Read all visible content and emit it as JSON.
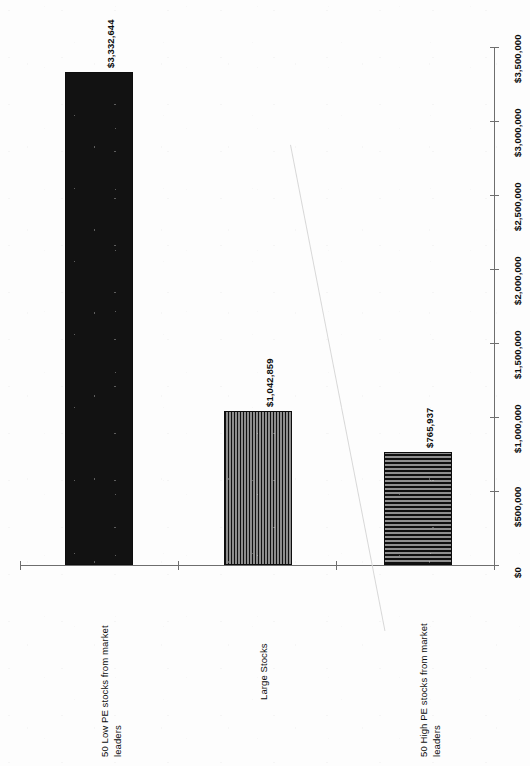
{
  "chart_data": {
    "type": "bar",
    "title": "",
    "subtitle": "",
    "xlabel": "",
    "ylabel": "",
    "orientation": "vertical-bars-rotated-90",
    "grid": false,
    "legend": null,
    "categories": [
      "50 Low PE stocks from market leaders",
      "Large Stocks",
      "50 High PE stocks from market leaders"
    ],
    "values": [
      3332644,
      1042859,
      765937
    ],
    "data_labels": [
      "$3,332,644",
      "$1,042,859",
      "$765,937"
    ],
    "fill_patterns": [
      "solid-black",
      "vertical-stripes",
      "horizontal-stripes"
    ],
    "ylim": [
      0,
      3500000
    ],
    "ytick_values": [
      0,
      500000,
      1000000,
      1500000,
      2000000,
      2500000,
      3000000,
      3500000
    ],
    "ytick_labels": [
      "$0",
      "$500,000",
      "$1,000,000",
      "$1,500,000",
      "$2,000,000",
      "$2,500,000",
      "$3,000,000",
      "$3,500,000"
    ]
  },
  "categories": {
    "bar1": {
      "line1": "50 Low PE stocks from market",
      "line2": "leaders"
    },
    "bar2": {
      "line1": "Large Stocks",
      "line2": ""
    },
    "bar3": {
      "line1": "50 High PE stocks from market",
      "line2": "leaders"
    }
  },
  "data_labels": {
    "bar1": "$3,332,644",
    "bar2": "$1,042,859",
    "bar3": "$765,937"
  },
  "ticks": {
    "t0": "$0",
    "t1": "$500,000",
    "t2": "$1,000,000",
    "t3": "$1,500,000",
    "t4": "$2,000,000",
    "t5": "$2,500,000",
    "t6": "$3,000,000",
    "t7": "$3,500,000"
  },
  "colors": {
    "axis": "#6e6e6e",
    "bar_solid": "#121212",
    "bar_stripe_dark": "#111111",
    "bar_stripe_light": "#8d8d8d",
    "text": "#0c0c0c",
    "background": "#fdfdfd",
    "artifact": "#d8d8d8"
  }
}
